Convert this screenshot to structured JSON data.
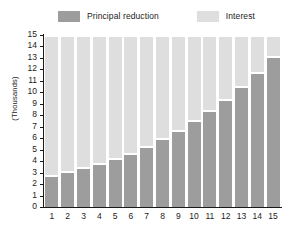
{
  "legend": {
    "entries": [
      {
        "label": "Principal reduction",
        "color": "#9d9d9d",
        "icon": "legend-swatch-principal"
      },
      {
        "label": "Interest",
        "color": "#dedede",
        "icon": "legend-swatch-interest"
      }
    ]
  },
  "chart_data": {
    "type": "bar",
    "title": "",
    "subtitle": "",
    "xlabel": "",
    "ylabel": "(Thousands)",
    "stacked": true,
    "grid": false,
    "legend_position": "top",
    "categories": [
      "1",
      "2",
      "3",
      "4",
      "5",
      "6",
      "7",
      "8",
      "9",
      "10",
      "11",
      "12",
      "13",
      "14",
      "15"
    ],
    "ylim": [
      0,
      15
    ],
    "yticks": [
      0,
      1,
      2,
      3,
      4,
      5,
      6,
      7,
      8,
      9,
      10,
      11,
      12,
      13,
      14,
      15
    ],
    "ytick_labels": [
      "0",
      "1",
      "2",
      "3",
      "4",
      "5",
      "6",
      "7",
      "8",
      "9",
      "10",
      "11",
      "12",
      "13",
      "14",
      "15"
    ],
    "series": [
      {
        "name": "Principal reduction",
        "color": "#9d9d9d",
        "values": [
          2.75,
          3.1,
          3.45,
          3.85,
          4.25,
          4.75,
          5.35,
          6.0,
          6.75,
          7.55,
          8.45,
          9.45,
          10.55,
          11.8,
          13.2
        ]
      },
      {
        "name": "Interest",
        "color": "#dedede",
        "values": [
          12.1,
          11.75,
          11.4,
          11.0,
          10.6,
          10.1,
          9.5,
          8.85,
          8.1,
          7.3,
          6.4,
          5.4,
          4.3,
          3.05,
          1.65
        ]
      }
    ],
    "totals": [
      14.85,
      14.85,
      14.85,
      14.85,
      14.85,
      14.85,
      14.85,
      14.85,
      14.85,
      14.85,
      14.85,
      14.85,
      14.85,
      14.85,
      14.85
    ]
  },
  "colors": {
    "principal": "#9d9d9d",
    "interest": "#dedede",
    "axis": "#1a1a1a",
    "background": "#ffffff"
  }
}
